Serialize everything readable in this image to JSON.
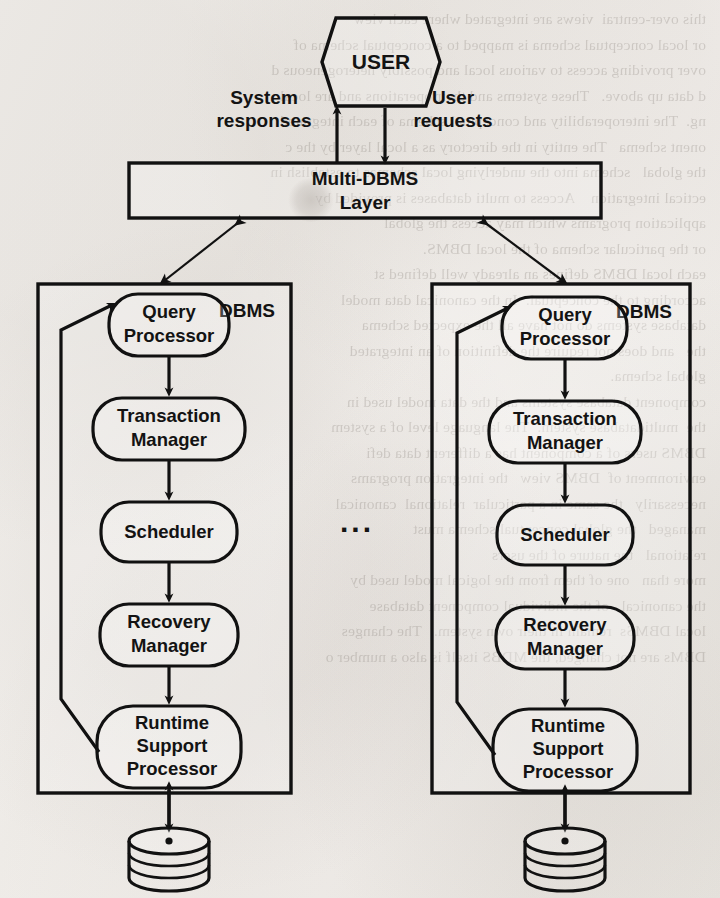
{
  "document": {
    "kind": "scanned-textbook-figure",
    "figure_type": "block-diagram",
    "background_color": "#f0ede9",
    "ink_color": "#111111"
  },
  "diagram": {
    "user_node": {
      "label": "USER",
      "shape": "hexagon"
    },
    "edges_to_user": [
      {
        "name": "system-responses",
        "label_line1": "System",
        "label_line2": "responses",
        "direction": "up"
      },
      {
        "name": "user-requests",
        "label_line1": "User",
        "label_line2": "requests",
        "direction": "down"
      }
    ],
    "middleware": {
      "label_line1": "Multi-DBMS",
      "label_line2": "Layer",
      "shape": "rectangle"
    },
    "ellipsis": "...",
    "dbms_instances": [
      {
        "name": "left-dbms",
        "title": "DBMS",
        "components": [
          {
            "id": "query-processor",
            "line1": "Query",
            "line2": "Processor",
            "line3": ""
          },
          {
            "id": "transaction-manager",
            "line1": "Transaction",
            "line2": "Manager",
            "line3": ""
          },
          {
            "id": "scheduler",
            "line1": "Scheduler",
            "line2": "",
            "line3": ""
          },
          {
            "id": "recovery-manager",
            "line1": "Recovery",
            "line2": "Manager",
            "line3": ""
          },
          {
            "id": "runtime-support-processor",
            "line1": "Runtime",
            "line2": "Support",
            "line3": "Processor"
          }
        ],
        "storage": {
          "id": "database-disk",
          "shape": "cylinder-stack",
          "label": ""
        }
      },
      {
        "name": "right-dbms",
        "title": "DBMS",
        "components": [
          {
            "id": "query-processor",
            "line1": "Query",
            "line2": "Processor",
            "line3": ""
          },
          {
            "id": "transaction-manager",
            "line1": "Transaction",
            "line2": "Manager",
            "line3": ""
          },
          {
            "id": "scheduler",
            "line1": "Scheduler",
            "line2": "",
            "line3": ""
          },
          {
            "id": "recovery-manager",
            "line1": "Recovery",
            "line2": "Manager",
            "line3": ""
          },
          {
            "id": "runtime-support-processor",
            "line1": "Runtime",
            "line2": "Support",
            "line3": "Processor"
          }
        ],
        "storage": {
          "id": "database-disk",
          "shape": "cylinder-stack",
          "label": ""
        }
      }
    ]
  },
  "ghost_text": {
    "column_left": "this over-centrai  views are integrated where each view\nor local conceptual schema is mapped to a conceptual schema of\nover providing access to various local and possibly heterogeneous d\nd data up above.   These systems and their operations and are local\nng.  The interoperability and conceptual schema of each integrated\nonent schema   The entity in the directory as a local layer by the c\nthe global   schema into the underlying local schemas to establish in\nectical integration    Access to multi databases is provided by",
    "column_right": "application programs which may access the global\nor the particular schema of the local DBMS.\neach local DBMS defines an already well defined st\naccording to the conceptual.  In the canonical data model\ndatabase systems do not have all the expected schema\nthe   and does not require the definition of an integrated\nglobal schema.\ncomponent database systems and the data model used in\nthe  multidatabase system.  The language level of a system\nDBMS users of a component has a different data defi\nenvironment of  DBMS view   the integration programs\nnecessarily   the same in a particular  relational  canonical\nmanaged   the global conceptual schema must\nrelational   the nature of the users\nmore than   one of them from the logical model used by\nthe canonical   of the individual component database\nlocal DBMSs  remain in their own system.   The changes\nDBMs are not changed, the MDBS itself is also a number o"
  }
}
